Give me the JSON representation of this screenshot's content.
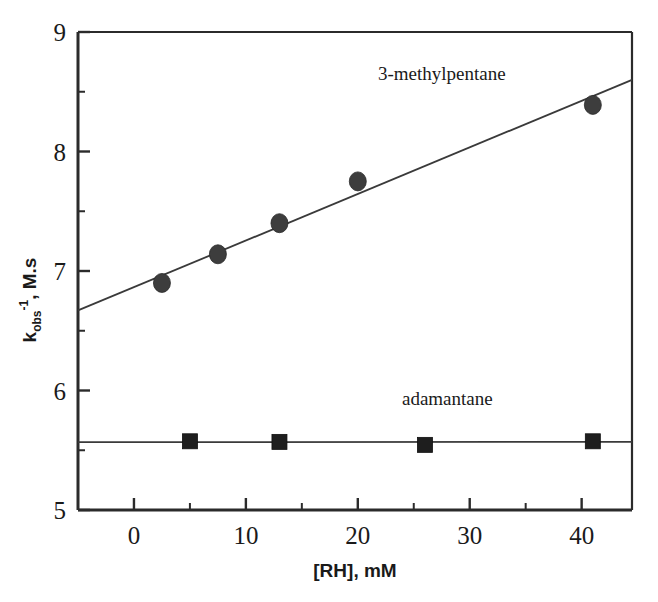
{
  "chart_data": {
    "type": "scatter",
    "title": "",
    "xlabel": "[RH], mM",
    "ylabel": "k_obs^-1 , M.s",
    "ylabel_parts": {
      "base": "k",
      "subscript": "obs",
      "superscript": "-1",
      "rest": ", M.s"
    },
    "xlim": [
      -5,
      44.5
    ],
    "ylim": [
      5,
      9
    ],
    "xticks": [
      0,
      10,
      20,
      30,
      40
    ],
    "xtick_labels": [
      "0",
      "10",
      "20",
      "30",
      "40"
    ],
    "xticks_minor": [
      -5,
      5,
      15,
      25,
      35
    ],
    "yticks": [
      5,
      6,
      7,
      8,
      9
    ],
    "ytick_labels": [
      "5",
      "6",
      "7",
      "8",
      "9"
    ],
    "yticks_minor": [
      5.5,
      6.5,
      7.5,
      8.5
    ],
    "grid": false,
    "legend_position": "inline-annotations",
    "series": [
      {
        "name": "3-methylpentane",
        "marker": "circle",
        "color": "#3d3d3d",
        "label_x": 27.5,
        "label_y": 8.6,
        "points": [
          {
            "x": 2.5,
            "y": 6.9
          },
          {
            "x": 7.5,
            "y": 7.14
          },
          {
            "x": 13.0,
            "y": 7.4
          },
          {
            "x": 20.0,
            "y": 7.75
          },
          {
            "x": 41.0,
            "y": 8.39
          }
        ],
        "fit_line": {
          "x1": -5.0,
          "y1": 6.67,
          "x2": 44.5,
          "y2": 8.6
        }
      },
      {
        "name": "adamantane",
        "marker": "square",
        "color": "#1e1e1e",
        "label_x": 28.0,
        "label_y": 5.88,
        "points": [
          {
            "x": 5.0,
            "y": 5.575
          },
          {
            "x": 13.0,
            "y": 5.57
          },
          {
            "x": 26.0,
            "y": 5.545
          },
          {
            "x": 41.0,
            "y": 5.575
          }
        ],
        "fit_line": {
          "x1": -5.0,
          "y1": 5.568,
          "x2": 44.5,
          "y2": 5.57
        }
      }
    ]
  }
}
